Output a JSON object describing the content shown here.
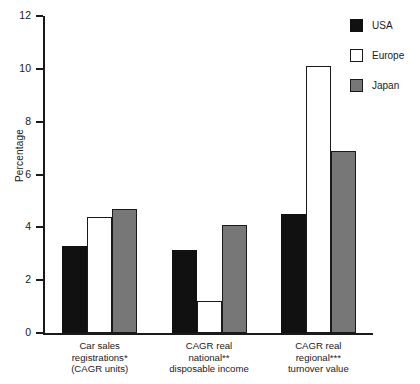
{
  "chart_data": {
    "type": "bar",
    "title": "",
    "xlabel": "",
    "ylabel": "Percentage",
    "ylim": [
      0,
      12
    ],
    "yticks": [
      0,
      2,
      4,
      6,
      8,
      10,
      12
    ],
    "ytick_labels": [
      "0",
      "2",
      "4",
      "6",
      "8",
      "10",
      "12"
    ],
    "grid": false,
    "legend_position": "top-right",
    "categories": [
      "Car sales\nregistrations*\n(CAGR units)",
      "CAGR real\nnational**\ndisposable income",
      "CAGR real\nregional***\nturnover value"
    ],
    "category_lines": [
      [
        "Car sales",
        "registrations*",
        "(CAGR units)"
      ],
      [
        "CAGR real",
        "national**",
        "disposable income"
      ],
      [
        "CAGR real",
        "regional***",
        "turnover value"
      ]
    ],
    "series": [
      {
        "name": "USA",
        "color": "#111111",
        "values": [
          3.3,
          3.15,
          4.5
        ]
      },
      {
        "name": "Europe",
        "color": "#ffffff",
        "values": [
          4.4,
          1.2,
          10.1
        ]
      },
      {
        "name": "Japan",
        "color": "#777777",
        "values": [
          4.7,
          4.1,
          6.9
        ]
      }
    ]
  },
  "legend": {
    "items": [
      {
        "label": "USA",
        "swatch": "legend-swatch-usa"
      },
      {
        "label": "Europe",
        "swatch": "legend-swatch-europe"
      },
      {
        "label": "Japan",
        "swatch": "legend-swatch-japan"
      }
    ]
  },
  "axis": {
    "y_title": "Percentage"
  }
}
